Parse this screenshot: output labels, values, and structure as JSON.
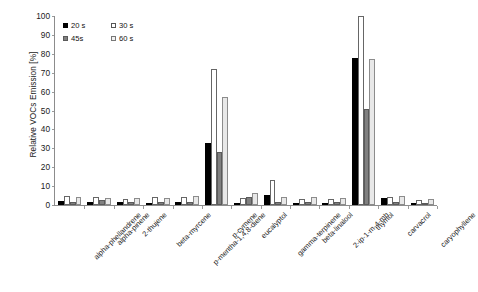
{
  "chart_data": {
    "type": "bar",
    "title": "",
    "xlabel": "",
    "ylabel": "Relative VOCs Emission [%]",
    "ylim": [
      0,
      100
    ],
    "yticks": [
      0,
      10,
      20,
      30,
      40,
      50,
      60,
      70,
      80,
      90,
      100
    ],
    "grid": false,
    "legend_position": "top-left",
    "categories": [
      "alpha-phellandrene",
      "alpha-pinene",
      "2-thujene",
      "beta-myrcene",
      "p-mentha-1,4,8-diene",
      "p-cymene",
      "eucalyptol",
      "gamma-terpinene",
      "beta-linalool",
      "2-ip-1-m-4-mb",
      "thymol",
      "carvacrol",
      "caryophyllene"
    ],
    "series": [
      {
        "name": "20 s",
        "color": "#000000",
        "values": [
          2.0,
          1.8,
          1.5,
          1.3,
          1.5,
          33.0,
          1.2,
          5.5,
          1.0,
          1.2,
          78.0,
          3.5,
          0.8
        ]
      },
      {
        "name": "30 s",
        "color": "#ffffff",
        "values": [
          5.0,
          4.5,
          3.2,
          4.0,
          4.5,
          72.0,
          3.5,
          13.5,
          3.0,
          3.2,
          100.0,
          4.5,
          2.5
        ]
      },
      {
        "name": "45s",
        "color": "#808080",
        "values": [
          1.5,
          2.5,
          1.5,
          1.8,
          1.5,
          28.0,
          4.0,
          1.8,
          1.5,
          1.5,
          51.0,
          1.5,
          1.2
        ]
      },
      {
        "name": "60 s",
        "color": "#e8e8e8",
        "values": [
          4.0,
          3.8,
          3.5,
          3.5,
          5.0,
          57.0,
          6.5,
          4.0,
          4.0,
          3.5,
          77.0,
          5.0,
          3.0
        ]
      }
    ]
  },
  "legend": {
    "entries": [
      {
        "label": "20 s",
        "key": "s20"
      },
      {
        "label": "30 s",
        "key": "s30"
      },
      {
        "label": "45s",
        "key": "s45"
      },
      {
        "label": "60 s",
        "key": "s60"
      }
    ]
  }
}
